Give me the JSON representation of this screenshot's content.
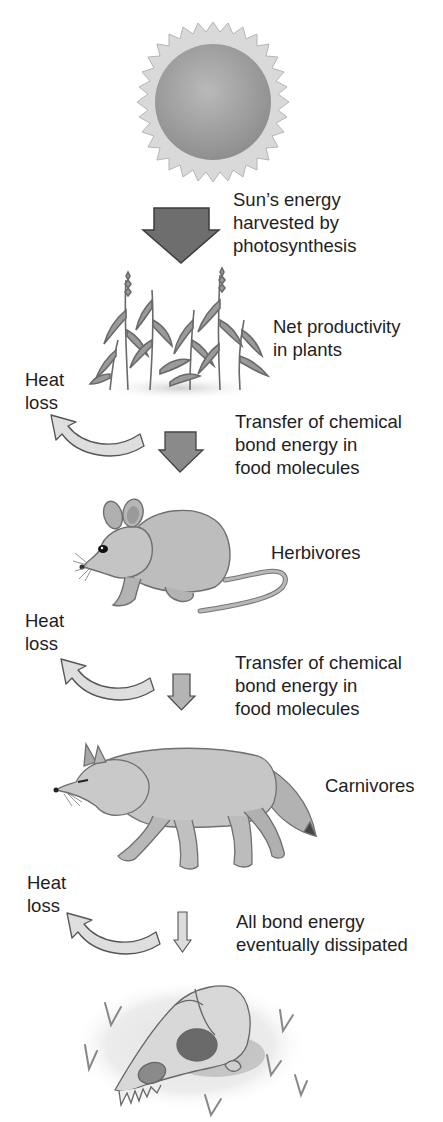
{
  "diagram": {
    "stages": [
      {
        "id": "sun",
        "illustration": "sun-icon"
      },
      {
        "id": "producers",
        "illustration": "plants-icon",
        "label_lines": [
          "Net productivity",
          "in plants"
        ]
      },
      {
        "id": "herbivores",
        "illustration": "mouse-icon",
        "label_lines": [
          "Herbivores"
        ]
      },
      {
        "id": "carnivores",
        "illustration": "fox-icon",
        "label_lines": [
          "Carnivores"
        ]
      },
      {
        "id": "decomposition",
        "illustration": "skull-icon"
      }
    ],
    "transfers": [
      {
        "from": "sun",
        "to": "producers",
        "arrow": "large-down-arrow",
        "color": "#6e6e6e",
        "label_lines": [
          "Sun’s energy",
          "harvested by",
          "photosynthesis"
        ]
      },
      {
        "from": "producers",
        "to": "herbivores",
        "arrow": "medium-down-arrow",
        "color": "#8a8a8a",
        "label_lines": [
          "Transfer of chemical",
          "bond energy in",
          "food molecules"
        ]
      },
      {
        "from": "herbivores",
        "to": "carnivores",
        "arrow": "small-down-arrow",
        "color": "#b4b4b4",
        "label_lines": [
          "Transfer of chemical",
          "bond energy in",
          "food molecules"
        ]
      },
      {
        "from": "carnivores",
        "to": "decomposition",
        "arrow": "thin-down-arrow",
        "color": "#dcdcdc",
        "label_lines": [
          "All bond energy",
          "eventually dissipated"
        ]
      }
    ],
    "heat_loss": [
      {
        "label_lines": [
          "Heat",
          "loss"
        ]
      },
      {
        "label_lines": [
          "Heat",
          "loss"
        ]
      },
      {
        "label_lines": [
          "Heat",
          "loss"
        ]
      }
    ]
  }
}
